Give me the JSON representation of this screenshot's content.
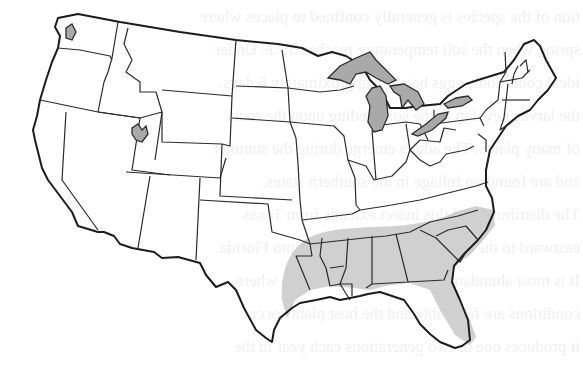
{
  "figure": {
    "shaded_region_label": "range",
    "shaded_states": [
      "Texas (east)",
      "Oklahoma (southeast)",
      "Arkansas",
      "Louisiana",
      "Mississippi",
      "Alabama",
      "Georgia",
      "Florida",
      "South Carolina",
      "North Carolina",
      "Tennessee (south)"
    ],
    "water_features": [
      "Puget Sound",
      "Great Salt Lake",
      "Lake Superior",
      "Lake Michigan",
      "Lake Huron",
      "Lake Erie",
      "Lake Ontario"
    ]
  },
  "colors": {
    "background": "#ffffff",
    "state_border": "#2a2a2a",
    "range_fill": "#d0d0d0",
    "water_fill": "#a9a9a9",
    "bleed_text": "#f1f1f1"
  },
  "bleed_through_text": [
    "tion of the species is generally confined to places where",
    "spring when the soil temperature reaches 55°F. Under",
    "ideal conditions, eggs hatch in approximately 6 days.",
    "the larvae develop in the soil feeding upon the roots",
    "of many plants. The adults emerge during the summer",
    "and are found on foliage in the southern states.",
    "The distribution of this insect extends from Texas",
    "eastward to the Carolinas and southward into Florida.",
    "It is most abundant in the Gulf Coast region where",
    "conditions are favorable and the host plants occur.",
    "it produces one or two generations each year in the"
  ]
}
